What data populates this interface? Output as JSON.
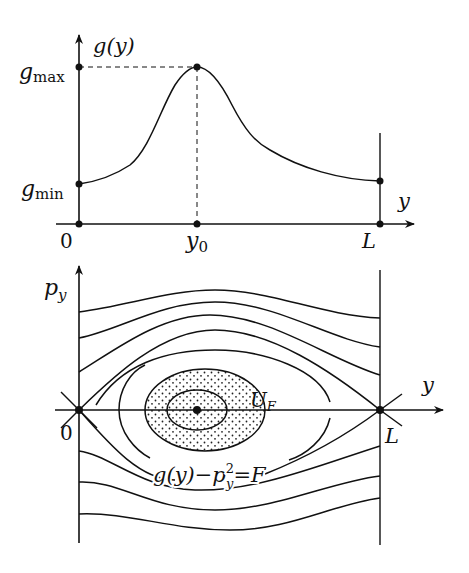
{
  "figure": {
    "top_panel": {
      "y_axis_label": "g(y)",
      "x_axis_label": "y",
      "ticks": {
        "g_max": {
          "base": "g",
          "sub": "max"
        },
        "g_min": {
          "base": "g",
          "sub": "min"
        },
        "origin": "0",
        "y0": {
          "base": "y",
          "sub": "0"
        },
        "L": "L"
      },
      "curve_description": "g(y) rises from g_min at y=0 to peak g_max at y0, then decays toward L"
    },
    "bottom_panel": {
      "y_axis_label": {
        "base": "p",
        "sub": "y"
      },
      "x_axis_label": "y",
      "origin": "0",
      "right_label": "L",
      "region_label": {
        "base": "U",
        "sub": "F"
      },
      "level_set_label": {
        "left": "g(y)−p",
        "sup": "2",
        "sub": "y",
        "right": "=F"
      }
    },
    "colors": {
      "ink": "#111111",
      "background": "#ffffff"
    }
  }
}
